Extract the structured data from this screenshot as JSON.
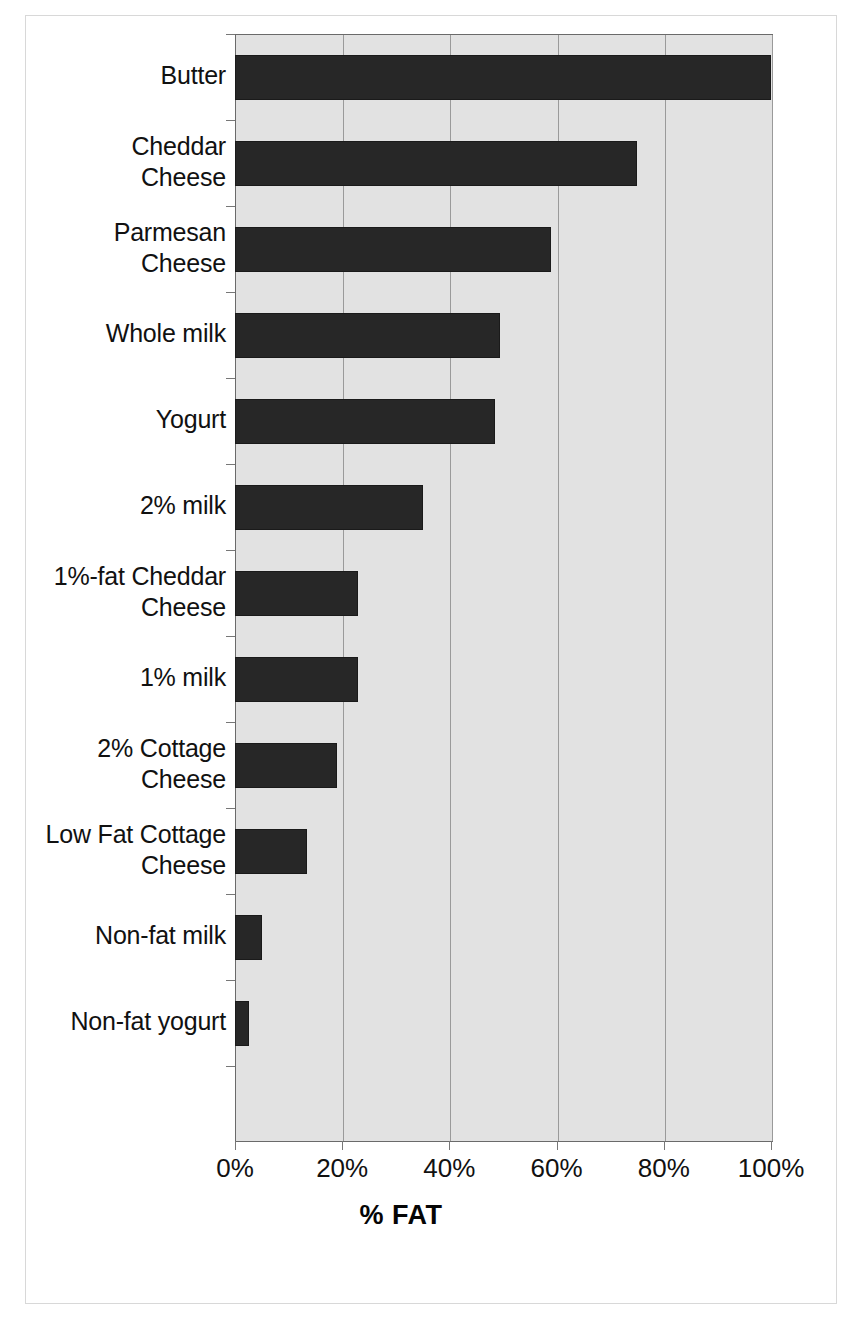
{
  "chart_data": {
    "type": "bar",
    "orientation": "horizontal",
    "title": "",
    "xlabel": "% FAT",
    "ylabel": "",
    "xlim": [
      0,
      100
    ],
    "xtick_labels": [
      "0%",
      "20%",
      "40%",
      "60%",
      "80%",
      "100%"
    ],
    "xticks": [
      0,
      20,
      40,
      60,
      80,
      100
    ],
    "grid": true,
    "legend": "none",
    "categories": [
      "Butter",
      "Cheddar Cheese",
      "Parmesan Cheese",
      "Whole milk",
      "Yogurt",
      "2% milk",
      "1%-fat Cheddar Cheese",
      "1% milk",
      "2% Cottage Cheese",
      "Low Fat Cottage Cheese",
      "Non-fat milk",
      "Non-fat yogurt"
    ],
    "category_lines": [
      [
        "Butter"
      ],
      [
        "Cheddar",
        "Cheese"
      ],
      [
        "Parmesan",
        "Cheese"
      ],
      [
        "Whole milk"
      ],
      [
        "Yogurt"
      ],
      [
        "2% milk"
      ],
      [
        "1%-fat Cheddar",
        "Cheese"
      ],
      [
        "1% milk"
      ],
      [
        "2% Cottage",
        "Cheese"
      ],
      [
        "Low Fat Cottage",
        "Cheese"
      ],
      [
        "Non-fat milk"
      ],
      [
        "Non-fat yogurt"
      ]
    ],
    "values": [
      100,
      75,
      59,
      49.5,
      48.5,
      35,
      23,
      23,
      19,
      13.5,
      5,
      2.7
    ],
    "value_labels": [
      "100%",
      "75%",
      "59%",
      "50%",
      "49%",
      "35%",
      "23%",
      "23%",
      "19%",
      "13%",
      "5%",
      "3%"
    ]
  },
  "style": {
    "plot_background": "#e2e2e2",
    "bar_color": "#272727",
    "gridline_color": "#9a9a9a",
    "axis_color": "#6a6a6a",
    "text_color": "#111111"
  }
}
